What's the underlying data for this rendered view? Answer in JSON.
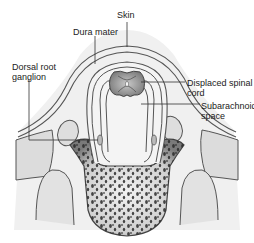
{
  "diagram": {
    "labels": [
      {
        "id": "skin",
        "text": "Skin"
      },
      {
        "id": "dura_mater",
        "text": "Dura mater"
      },
      {
        "id": "dorsal_root_ganglion",
        "text": "Dorsal root\nganglion"
      },
      {
        "id": "displaced_spinal_cord",
        "text": "Displaced spinal\ncord"
      },
      {
        "id": "subarachnoid_space",
        "text": "Subarachnoid\nspace"
      }
    ],
    "colors": {
      "outline": "#555555",
      "tissue_fill": "#e6e6e6",
      "membrane": "#bdbdbd",
      "bone_fill": "#8c8c8c",
      "bone_pores": "#2a2a2a",
      "cord_fill": "#9a9a9a",
      "leader_line": "#333333"
    }
  }
}
